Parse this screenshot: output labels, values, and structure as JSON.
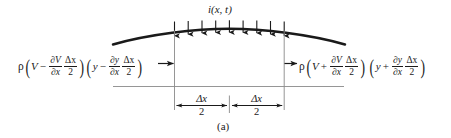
{
  "figure": {
    "caption": "(a)",
    "load_label": "i(x, t)",
    "left_force": {
      "rho": "ρ",
      "lparen1": "(",
      "V": "V",
      "sign1": "−",
      "dV_num": "∂V",
      "dV_den": "∂x",
      "dx_num": "Δx",
      "dx_den": "2",
      "rparen1": ")",
      "lparen2": "(",
      "y": "y",
      "sign2": "−",
      "dy_num": "∂y",
      "dy_den": "∂x",
      "dx2_num": "Δx",
      "dx2_den": "2",
      "rparen2": ")",
      "plain": "ρ(V − ∂V/∂x · Δx/2)(y − ∂y/∂x · Δx/2)"
    },
    "right_force": {
      "rho": "ρ",
      "lparen1": "(",
      "V": "V",
      "sign1": "+",
      "dV_num": "∂V",
      "dV_den": "∂x",
      "dx_num": "Δx",
      "dx_den": "2",
      "rparen1": ")",
      "lparen2": "(",
      "y": "y",
      "sign2": "+",
      "dy_num": "∂y",
      "dy_den": "∂x",
      "dx2_num": "Δx",
      "dx2_den": "2",
      "rparen2": ")",
      "plain": "ρ(V + ∂V/∂x · Δx/2)(y + ∂y/∂x · Δx/2)"
    },
    "dimension_left": {
      "num": "Δx",
      "den": "2",
      "plain": "Δx/2"
    },
    "dimension_right": {
      "num": "Δx",
      "den": "2",
      "plain": "Δx/2"
    },
    "distributed_load_arrow_count": 9,
    "colors": {
      "ink": "#1a1a1a",
      "thin_rule": "#7a7a7a",
      "background": "#ffffff"
    }
  }
}
